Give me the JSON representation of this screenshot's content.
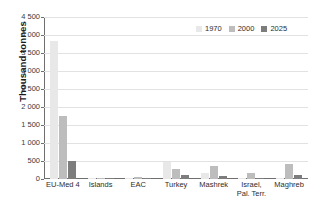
{
  "chart_data": {
    "type": "bar",
    "title": "",
    "xlabel": "",
    "ylabel": "Thousand tonnes",
    "ylim": [
      0,
      4500
    ],
    "ytick_step": 500,
    "ytick_labels": [
      "4 500",
      "4 000",
      "3 500",
      "3 000",
      "2 500",
      "2 000",
      "1 500",
      "1 000",
      "500",
      "0"
    ],
    "grid": true,
    "legend_position": "top-right",
    "categories": [
      "EU-Med 4",
      "Islands",
      "EAC",
      "Turkey",
      "Mashrek",
      "Israel, Pal. Terr.",
      "Maghreb"
    ],
    "category_lines": [
      [
        "EU-Med 4"
      ],
      [
        "Islands"
      ],
      [
        "EAC"
      ],
      [
        "Turkey"
      ],
      [
        "Mashrek"
      ],
      [
        "Israel,",
        "Pal. Terr."
      ],
      [
        "Maghreb"
      ]
    ],
    "series": [
      {
        "name": "1970",
        "color": "#e8e8e8",
        "values": [
          3840,
          10,
          8,
          470,
          160,
          20,
          30
        ]
      },
      {
        "name": "2000",
        "color": "#bdbdbd",
        "values": [
          1750,
          15,
          50,
          290,
          350,
          170,
          420
        ]
      },
      {
        "name": "2025",
        "color": "#7d7d7d",
        "values": [
          510,
          8,
          25,
          120,
          80,
          35,
          100
        ]
      }
    ]
  },
  "colors": {
    "series_1970": "#e8e8e8",
    "series_2000": "#bdbdbd",
    "series_2025": "#7d7d7d",
    "axis": "#6f6f6f",
    "grid": "#e2e2e2",
    "text": "#2d2d2d",
    "background": "#ffffff"
  }
}
